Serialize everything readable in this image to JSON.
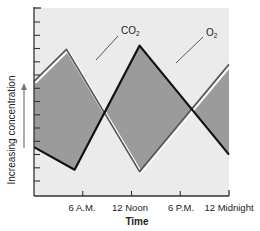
{
  "chart_data": {
    "type": "line",
    "title": "",
    "xlabel": "Time",
    "ylabel": "Increasing concentration",
    "x_ticks": [
      "6 A.M.",
      "12 Noon",
      "6 P.M.",
      "12 Midnight"
    ],
    "x_hours": [
      0,
      6,
      12,
      18,
      24
    ],
    "grid": false,
    "y_tick_count": 13,
    "legend_position": "inline labels",
    "series": [
      {
        "name": "CO₂",
        "label": "CO",
        "subscript": "2",
        "style": "gray line with white highlight",
        "points": [
          [
            0,
            0.61
          ],
          [
            4,
            0.78
          ],
          [
            13,
            0.13
          ],
          [
            24,
            0.7
          ]
        ]
      },
      {
        "name": "O₂",
        "label": "O",
        "subscript": "2",
        "style": "black line",
        "points": [
          [
            0,
            0.26
          ],
          [
            5,
            0.14
          ],
          [
            13,
            0.8
          ],
          [
            24,
            0.22
          ]
        ]
      }
    ],
    "colors": {
      "plot_background": "#ebebeb",
      "fill_between": "#9b9b9b",
      "o2_line": "#111111",
      "co2_line": "#5a5a5a",
      "axis": "#333333"
    }
  }
}
